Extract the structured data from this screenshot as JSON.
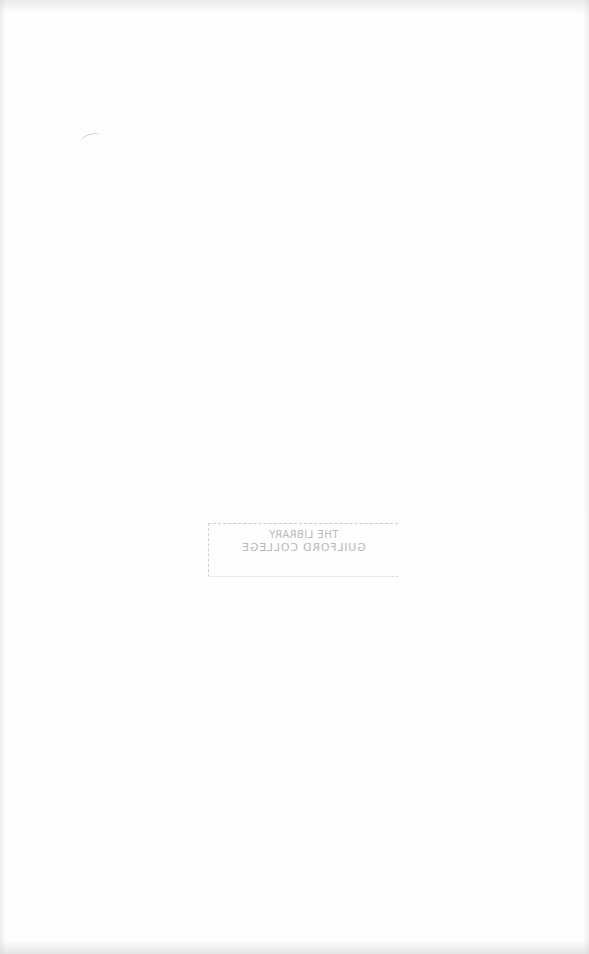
{
  "page": {
    "type": "blank scanned page",
    "background_color": "#fefefe"
  },
  "stamp": {
    "orientation": "mirrored (bleed-through)",
    "line1": "THE LIBRARY",
    "line2": "GUILFORD COLLEGE",
    "line3": "",
    "ink_color": "#a9a9a9"
  }
}
